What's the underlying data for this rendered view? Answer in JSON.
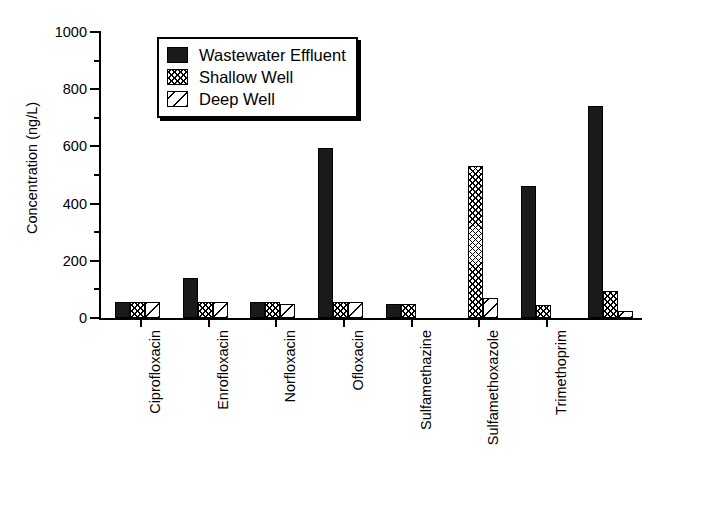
{
  "chart_data": {
    "type": "bar",
    "title": "",
    "xlabel": "",
    "ylabel": "Concentration (ng/L)",
    "ylim": [
      0,
      1000
    ],
    "ytick_major": [
      0,
      200,
      400,
      600,
      800,
      1000
    ],
    "ytick_minor": [
      100,
      300,
      500,
      700,
      900
    ],
    "grid": false,
    "legend_position": "upper-left-inside",
    "categories": [
      "Ciprofloxacin",
      "Enrofloxacin",
      "Norfloxacin",
      "Ofloxacin",
      "Sulfamethazine",
      "Sulfamethoxazole",
      "Trimethoprim"
    ],
    "series": [
      {
        "name": "Wastewater Effluent",
        "pattern": "solid",
        "values": [
          55,
          140,
          55,
          595,
          50,
          0,
          460
        ]
      },
      {
        "name": "Shallow Well",
        "pattern": "cross-hatch",
        "values": [
          55,
          55,
          55,
          55,
          50,
          530,
          45
        ]
      },
      {
        "name": "Deep Well",
        "pattern": "diagonal",
        "values": [
          55,
          55,
          50,
          55,
          0,
          70,
          0
        ]
      }
    ],
    "extra_group": {
      "name": "Trimethoprim (second cluster)",
      "values": {
        "Wastewater Effluent": 740,
        "Shallow Well": 95,
        "Deep Well": 25
      }
    }
  },
  "axis": {
    "y_title": "Concentration (ng/L)",
    "y_ticks": [
      "0",
      "200",
      "400",
      "600",
      "800",
      "1000"
    ]
  },
  "legend": {
    "items": [
      {
        "label": "Wastewater Effluent",
        "pattern": "solid"
      },
      {
        "label": "Shallow Well",
        "pattern": "cross-hatch"
      },
      {
        "label": "Deep Well",
        "pattern": "diagonal"
      }
    ]
  },
  "x_labels": [
    "Ciprofloxacin",
    "Enrofloxacin",
    "Norfloxacin",
    "Ofloxacin",
    "Sulfamethazine",
    "Sulfamethoxazole",
    "Trimethoprim"
  ]
}
